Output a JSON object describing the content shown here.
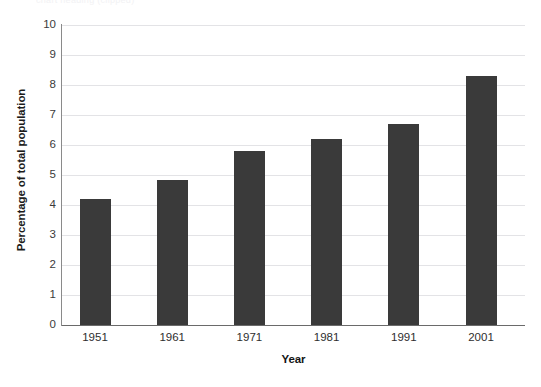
{
  "artifact": {
    "clipped_top_text": "chart heading (clipped)"
  },
  "chart_data": {
    "type": "bar",
    "title": "",
    "subtitle": "",
    "categories": [
      "1951",
      "1961",
      "1971",
      "1981",
      "1991",
      "2001"
    ],
    "values": [
      4.2,
      4.85,
      5.8,
      6.2,
      6.7,
      8.3
    ],
    "series": [
      {
        "name": "Percentage of total population",
        "values": [
          4.2,
          4.85,
          5.8,
          6.2,
          6.7,
          8.3
        ]
      }
    ],
    "xlabel": "Year",
    "ylabel": "Percentage of total population",
    "ylim": [
      0,
      10
    ],
    "ytick_step": 1,
    "yticks": [
      "10",
      "9",
      "8",
      "7",
      "6",
      "5",
      "4",
      "3",
      "2",
      "1",
      "0"
    ],
    "ytick_values": [
      10,
      9,
      8,
      7,
      6,
      5,
      4,
      3,
      2,
      1,
      0
    ],
    "grid": true,
    "grid_axis": "y",
    "legend": false,
    "legend_position": "none",
    "bar_color": "#3a3a3a",
    "grid_color": "#e3e3e6",
    "axis_color": "#6a6a6a",
    "background": "#ffffff",
    "annotations": []
  }
}
